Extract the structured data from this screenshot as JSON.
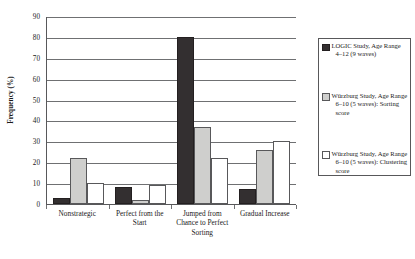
{
  "chart_data": {
    "type": "bar",
    "title": "",
    "xlabel": "",
    "ylabel": "Frequency (%)",
    "ylim": [
      0,
      90
    ],
    "yticks": [
      0,
      10,
      20,
      30,
      40,
      50,
      60,
      70,
      80,
      90
    ],
    "ytick_labels": [
      "0",
      "10",
      "20",
      "30",
      "40",
      "50",
      "60",
      "70",
      "80",
      "90"
    ],
    "grid": true,
    "legend_position": "right",
    "categories": [
      "Nonstrategic",
      "Perfect from the Start",
      "Jumped from Chance to Perfect Sorting",
      "Gradual Increase"
    ],
    "series": [
      {
        "name": "LOGIC Study, Age Range 4–12 (9 waves)",
        "color": "#332f30",
        "values": [
          3,
          8,
          80,
          7
        ]
      },
      {
        "name": "Würzburg Study, Age Range 6–10 (5 waves): Sorting score",
        "color": "#cfcfcd",
        "values": [
          22,
          2,
          37,
          26
        ]
      },
      {
        "name": "Würzburg Study, Age Range 6–10 (5 waves): Clustering score",
        "color": "#ffffff",
        "values": [
          10,
          9,
          22,
          30
        ]
      }
    ]
  },
  "legend": {
    "entries": [
      {
        "label": "LOGIC Study, Age Range 4–12 (9 waves)",
        "swatch": "black-filled-square-icon"
      },
      {
        "label": "Würzburg Study, Age Range 6–10 (5 waves): Sorting score",
        "swatch": "gray-filled-square-icon"
      },
      {
        "label": "Würzburg Study, Age Range 6–10 (5 waves): Clustering score",
        "swatch": "white-open-square-icon"
      }
    ]
  }
}
